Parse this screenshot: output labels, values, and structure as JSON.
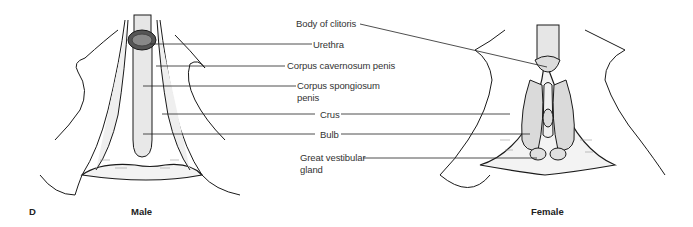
{
  "figure": {
    "panel_letter": "D",
    "captions": {
      "male": "Male",
      "female": "Female"
    },
    "labels": {
      "body_of_clitoris": "Body of clitoris",
      "urethra": "Urethra",
      "corpus_cavernosum": "Corpus cavernosum penis",
      "corpus_spongiosum_line1": "Corpus spongiosum",
      "corpus_spongiosum_line2": "penis",
      "crus": "Crus",
      "bulb": "Bulb",
      "great_vestibular_line1": "Great vestibular",
      "great_vestibular_line2": "gland"
    },
    "colors": {
      "line": "#1a1a1a",
      "tissue": "#ececec",
      "tissue_dark": "#d6d6d6",
      "text": "#333333"
    }
  }
}
